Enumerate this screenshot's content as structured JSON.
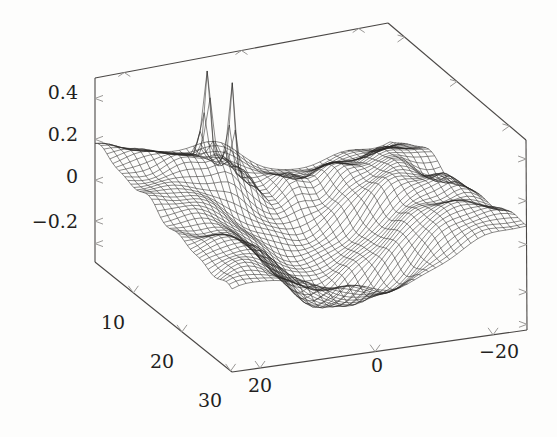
{
  "chart_data": {
    "type": "surface",
    "title": "",
    "xlabel": "",
    "ylabel": "",
    "zlabel": "",
    "grid": false,
    "legend": null,
    "axes": {
      "z": {
        "tick_labels": [
          "0.4",
          "0.2",
          "0",
          "-0.2"
        ],
        "tick_values": [
          0.4,
          0.2,
          0,
          -0.2
        ],
        "range": [
          -0.4,
          0.5
        ],
        "minor_ticks": 5
      },
      "left_bottom": {
        "tick_labels": [
          "10",
          "20",
          "30"
        ],
        "tick_values": [
          10,
          20,
          30
        ],
        "range": [
          0,
          35
        ]
      },
      "right_bottom": {
        "tick_labels": [
          "20",
          "0",
          "-20"
        ],
        "tick_values": [
          20,
          0,
          -20
        ],
        "range": [
          28,
          -28
        ]
      }
    },
    "surface": {
      "nu": 46,
      "nv": 42,
      "zmin": -0.33,
      "zmax": 0.52,
      "description": "dense wireframe mesh surface with two tall narrow spikes near the back-left-center and wavy oscillating ridges toward the right"
    },
    "peaks": [
      {
        "label": "spike-1",
        "z": 0.5
      },
      {
        "label": "spike-2",
        "z": 0.52
      }
    ]
  },
  "colors": {
    "background": "#fdfdfc",
    "mesh": "#2b2927",
    "axis": "#4a4745",
    "tick": "#9a9896",
    "label": "#231f1e"
  },
  "geometry": {
    "corner_back_left": [
      95,
      78
    ],
    "corner_back_right": [
      388,
      23
    ],
    "corner_right": [
      526,
      140
    ],
    "corner_front": [
      232,
      372
    ],
    "corner_left_bottom": [
      95,
      262
    ],
    "corner_right_bottom": [
      527,
      330
    ]
  },
  "tick_labels": {
    "z": [
      {
        "text": "0.4",
        "x": 78,
        "y": 99
      },
      {
        "text": "0.2",
        "x": 78,
        "y": 141
      },
      {
        "text": "0",
        "x": 78,
        "y": 183
      },
      {
        "text": "−0.2",
        "x": 78,
        "y": 228
      }
    ],
    "left_bottom": [
      {
        "text": "10",
        "x": 101,
        "y": 329
      },
      {
        "text": "20",
        "x": 150,
        "y": 368
      },
      {
        "text": "30",
        "x": 198,
        "y": 407
      }
    ],
    "right_bottom": [
      {
        "text": "20",
        "x": 248,
        "y": 392
      },
      {
        "text": "0",
        "x": 371,
        "y": 372
      },
      {
        "text": "−20",
        "x": 479,
        "y": 358
      }
    ]
  }
}
